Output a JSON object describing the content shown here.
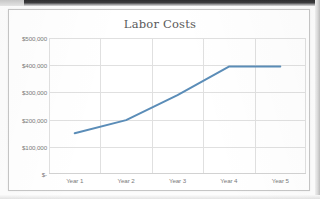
{
  "chart_data": {
    "type": "line",
    "title": "Labor Costs",
    "xlabel": "",
    "ylabel": "",
    "categories": [
      "Year 1",
      "Year 2",
      "Year 3",
      "Year 4",
      "Year 5"
    ],
    "series": [
      {
        "name": "Labor Costs",
        "values": [
          150000,
          198000,
          290000,
          395000,
          395000
        ],
        "color": "#5b8db8"
      }
    ],
    "ylim": [
      0,
      500000
    ],
    "ytick_values": [
      0,
      100000,
      200000,
      300000,
      400000,
      500000
    ],
    "ytick_labels": [
      "$-",
      "$100,000",
      "$200,000",
      "$300,000",
      "$400,000",
      "$500,000"
    ],
    "grid": {
      "horizontal": true,
      "vertical": true,
      "color": "#e0e0e0"
    },
    "legend": {
      "visible": false,
      "position": "none"
    },
    "markers": false,
    "line_width": 2
  },
  "style": {
    "plot_background": "#ffffff",
    "chart_border": "#c6c6c6",
    "title_color": "#5a5a5a",
    "tick_color": "#7b7b7b",
    "accent": "#5b8db8"
  }
}
